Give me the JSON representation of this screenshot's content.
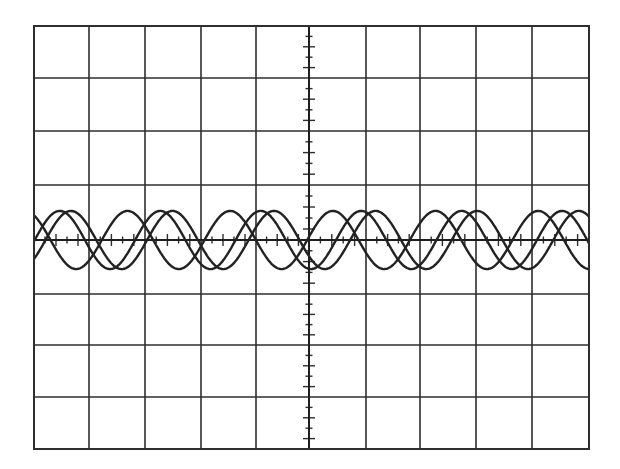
{
  "chart_data": {
    "type": "line",
    "title": "",
    "xlabel": "",
    "ylabel": "",
    "grid": true,
    "legend": null,
    "grid_divisions": {
      "x": 10,
      "y": 8
    },
    "subdivisions_per_division": 5,
    "xlim": [
      -5,
      5
    ],
    "ylim": [
      -4,
      4
    ],
    "x_unit": "divisions",
    "y_unit": "divisions",
    "series": [
      {
        "name": "trace-1",
        "amplitude_div": 0.55,
        "period_div": 1.85,
        "first_peak_x_div": -5.12,
        "offset_div": 0
      },
      {
        "name": "trace-2",
        "amplitude_div": 0.55,
        "period_div": 1.81,
        "first_peak_x_div": -4.49,
        "offset_div": 0
      },
      {
        "name": "trace-3",
        "amplitude_div": 0.55,
        "period_div": 1.83,
        "first_peak_x_div": -4.29,
        "offset_div": 0
      }
    ]
  },
  "display": {
    "background": "#ffffff",
    "line_color": "#2e2e2e",
    "trace_color": "#222222",
    "grid_x_px": [
      34,
      89,
      145,
      201,
      256,
      309,
      366,
      420,
      476,
      532,
      589
    ],
    "grid_y_px": [
      26,
      78,
      131,
      185,
      240,
      294,
      345,
      397,
      449
    ]
  }
}
